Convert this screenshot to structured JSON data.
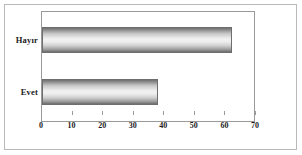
{
  "chart_data": {
    "type": "bar",
    "orientation": "horizontal",
    "title": "",
    "xlabel": "",
    "ylabel": "",
    "categories": [
      "Evet",
      "Hayır"
    ],
    "values": [
      38,
      62
    ],
    "series": [
      {
        "name": "",
        "values": [
          38,
          62
        ]
      }
    ],
    "xticks": [
      0,
      10,
      20,
      30,
      40,
      50,
      60,
      70
    ],
    "xticklabels": [
      "0",
      "10",
      "20",
      "30",
      "40",
      "50",
      "60",
      "70"
    ],
    "xlim": [
      0,
      70
    ],
    "grid": false,
    "legend": false,
    "legend_position": "none",
    "bar_fill": "#c9c9c9",
    "bar_edge": "#6e6e6e",
    "axis_color": "#9a9a9a",
    "frame_color": "#b9b9b9",
    "text_color": "#1b1b1b"
  }
}
